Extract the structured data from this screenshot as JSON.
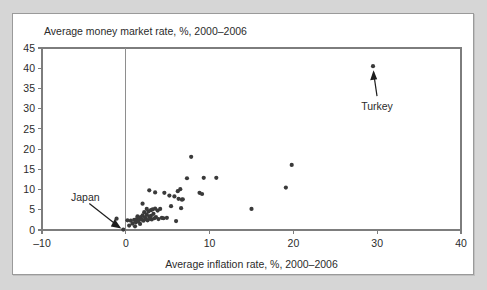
{
  "figure": {
    "background_color": "#d6d6d6",
    "panel_color": "#ffffff",
    "border_color": "#9a9a9a"
  },
  "annotations": {
    "turkey": {
      "label": "Turkey",
      "point_x": 29.5,
      "point_y": 40.5
    },
    "japan": {
      "label": "Japan",
      "point_x": -0.3,
      "point_y": 0.1
    }
  },
  "chart_data": {
    "type": "scatter",
    "title": "Average money market rate, %, 2000–2006",
    "xlabel": "Average inflation rate, %, 2000–2006",
    "ylabel": "Average money market rate, %, 2000–2006",
    "xlim": [
      -10,
      40
    ],
    "ylim": [
      0,
      45
    ],
    "xticks": [
      -10,
      0,
      10,
      20,
      30,
      40
    ],
    "yticks": [
      0,
      5,
      10,
      15,
      20,
      25,
      30,
      35,
      40,
      45
    ],
    "xtick_labels": [
      "–10",
      "0",
      "10",
      "20",
      "30",
      "40"
    ],
    "ytick_labels": [
      "0",
      "5",
      "10",
      "15",
      "20",
      "25",
      "30",
      "35",
      "40",
      "45"
    ],
    "grid": false,
    "legend": "none",
    "marker_color": "#3a3a3a",
    "marker_size": 2.1,
    "points": [
      [
        -1.1,
        2.8
      ],
      [
        -0.3,
        0.1
      ],
      [
        0.2,
        2.4
      ],
      [
        0.4,
        1.1
      ],
      [
        0.6,
        2.3
      ],
      [
        0.8,
        1.6
      ],
      [
        1.0,
        2.5
      ],
      [
        1.1,
        0.9
      ],
      [
        1.2,
        1.9
      ],
      [
        1.3,
        2.7
      ],
      [
        1.4,
        3.4
      ],
      [
        1.5,
        2.1
      ],
      [
        1.6,
        2.9
      ],
      [
        1.7,
        1.5
      ],
      [
        1.8,
        3.2
      ],
      [
        1.9,
        2.6
      ],
      [
        2.0,
        6.5
      ],
      [
        2.0,
        3.6
      ],
      [
        2.1,
        2.3
      ],
      [
        2.2,
        4.4
      ],
      [
        2.3,
        3.1
      ],
      [
        2.4,
        2.7
      ],
      [
        2.5,
        5.2
      ],
      [
        2.5,
        3.8
      ],
      [
        2.6,
        2.4
      ],
      [
        2.7,
        4.6
      ],
      [
        2.8,
        3.3
      ],
      [
        2.8,
        9.8
      ],
      [
        2.9,
        2.8
      ],
      [
        3.0,
        4.9
      ],
      [
        3.0,
        3.5
      ],
      [
        3.1,
        2.6
      ],
      [
        3.2,
        5.1
      ],
      [
        3.3,
        4.0
      ],
      [
        3.4,
        2.9
      ],
      [
        3.5,
        9.3
      ],
      [
        3.5,
        5.3
      ],
      [
        3.6,
        3.2
      ],
      [
        3.8,
        4.8
      ],
      [
        3.9,
        2.7
      ],
      [
        4.1,
        5.2
      ],
      [
        4.3,
        3.0
      ],
      [
        4.5,
        2.9
      ],
      [
        4.6,
        9.2
      ],
      [
        4.9,
        3.0
      ],
      [
        5.2,
        8.5
      ],
      [
        5.4,
        5.9
      ],
      [
        5.8,
        8.3
      ],
      [
        6.0,
        2.2
      ],
      [
        6.2,
        9.6
      ],
      [
        6.3,
        7.7
      ],
      [
        6.5,
        10.1
      ],
      [
        6.6,
        5.4
      ],
      [
        6.7,
        7.5
      ],
      [
        6.8,
        7.6
      ],
      [
        7.3,
        12.8
      ],
      [
        7.8,
        18.1
      ],
      [
        8.8,
        9.2
      ],
      [
        9.1,
        8.9
      ],
      [
        9.3,
        12.9
      ],
      [
        10.8,
        12.9
      ],
      [
        15.0,
        5.2
      ],
      [
        19.1,
        10.5
      ],
      [
        19.8,
        16.1
      ],
      [
        29.5,
        40.5
      ]
    ]
  }
}
